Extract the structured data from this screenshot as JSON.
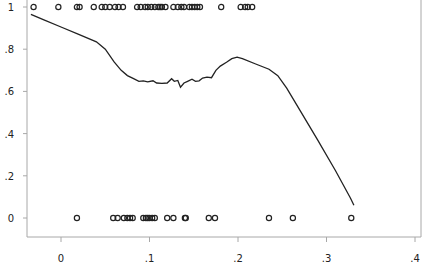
{
  "chart_data": {
    "type": "scatter",
    "title": "",
    "xlabel": "",
    "ylabel": "",
    "xlim": [
      -0.04,
      0.405
    ],
    "ylim": [
      -0.08,
      1.02
    ],
    "grid": false,
    "legend": "none",
    "x_ticks": [
      {
        "value": 0,
        "label": "0"
      },
      {
        "value": 0.1,
        "label": ".1"
      },
      {
        "value": 0.2,
        "label": ".2"
      },
      {
        "value": 0.3,
        "label": ".3"
      },
      {
        "value": 0.4,
        "label": ".4"
      }
    ],
    "y_ticks": [
      {
        "value": 0,
        "label": "0"
      },
      {
        "value": 0.2,
        "label": ".2"
      },
      {
        "value": 0.4,
        "label": ".4"
      },
      {
        "value": 0.6,
        "label": ".6"
      },
      {
        "value": 0.8,
        "label": ".8"
      },
      {
        "value": 1,
        "label": "1"
      }
    ],
    "series": [
      {
        "name": "observations y=1",
        "type": "scatter",
        "marker": "hollow-circle",
        "y": 1,
        "x": [
          -0.031,
          -0.003,
          0.018,
          0.021,
          0.037,
          0.046,
          0.05,
          0.055,
          0.061,
          0.065,
          0.07,
          0.086,
          0.09,
          0.095,
          0.098,
          0.102,
          0.106,
          0.11,
          0.112,
          0.114,
          0.118,
          0.127,
          0.132,
          0.136,
          0.139,
          0.145,
          0.148,
          0.151,
          0.154,
          0.157,
          0.181,
          0.203,
          0.208,
          0.211,
          0.216
        ]
      },
      {
        "name": "observations y=0",
        "type": "scatter",
        "marker": "hollow-circle",
        "y": 0,
        "x": [
          0.018,
          0.059,
          0.064,
          0.071,
          0.075,
          0.078,
          0.081,
          0.093,
          0.096,
          0.098,
          0.1,
          0.103,
          0.106,
          0.12,
          0.127,
          0.14,
          0.141,
          0.167,
          0.174,
          0.235,
          0.262,
          0.328
        ]
      },
      {
        "name": "smoothed fit",
        "type": "line",
        "points": [
          [
            -0.034,
            0.965
          ],
          [
            -0.02,
            0.94
          ],
          [
            0.0,
            0.905
          ],
          [
            0.02,
            0.87
          ],
          [
            0.04,
            0.835
          ],
          [
            0.05,
            0.8
          ],
          [
            0.06,
            0.74
          ],
          [
            0.068,
            0.7
          ],
          [
            0.075,
            0.675
          ],
          [
            0.082,
            0.66
          ],
          [
            0.088,
            0.648
          ],
          [
            0.093,
            0.65
          ],
          [
            0.098,
            0.645
          ],
          [
            0.104,
            0.65
          ],
          [
            0.108,
            0.64
          ],
          [
            0.114,
            0.638
          ],
          [
            0.12,
            0.64
          ],
          [
            0.125,
            0.66
          ],
          [
            0.128,
            0.648
          ],
          [
            0.132,
            0.652
          ],
          [
            0.135,
            0.62
          ],
          [
            0.139,
            0.64
          ],
          [
            0.143,
            0.648
          ],
          [
            0.148,
            0.658
          ],
          [
            0.152,
            0.648
          ],
          [
            0.156,
            0.65
          ],
          [
            0.16,
            0.663
          ],
          [
            0.165,
            0.668
          ],
          [
            0.17,
            0.665
          ],
          [
            0.175,
            0.7
          ],
          [
            0.18,
            0.72
          ],
          [
            0.187,
            0.738
          ],
          [
            0.193,
            0.755
          ],
          [
            0.199,
            0.762
          ],
          [
            0.205,
            0.755
          ],
          [
            0.22,
            0.73
          ],
          [
            0.235,
            0.705
          ],
          [
            0.245,
            0.675
          ],
          [
            0.255,
            0.615
          ],
          [
            0.27,
            0.51
          ],
          [
            0.29,
            0.37
          ],
          [
            0.31,
            0.225
          ],
          [
            0.327,
            0.095
          ],
          [
            0.331,
            0.06
          ]
        ]
      }
    ]
  }
}
